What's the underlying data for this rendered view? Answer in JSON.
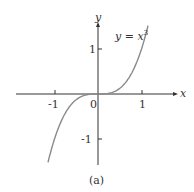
{
  "chart_data": {
    "type": "line",
    "title": "",
    "function": "y = x^3",
    "curve_label": "y = x",
    "curve_label_exp": "3",
    "xlabel": "x",
    "ylabel": "y",
    "x_ticks": [
      "-1",
      "1"
    ],
    "y_ticks": [
      "1",
      "-1"
    ],
    "origin_label": "0",
    "xlim": [
      -1.9,
      1.8
    ],
    "ylim": [
      -1.6,
      1.6
    ],
    "x": [
      -1.15,
      -1.0,
      -0.75,
      -0.5,
      -0.25,
      0,
      0.25,
      0.5,
      0.75,
      1.0,
      1.15
    ],
    "y": [
      -1.52,
      -1.0,
      -0.42,
      -0.125,
      -0.016,
      0,
      0.016,
      0.125,
      0.42,
      1.0,
      1.52
    ],
    "grid": false,
    "caption": "(a)",
    "color": "#8a8a8a"
  }
}
